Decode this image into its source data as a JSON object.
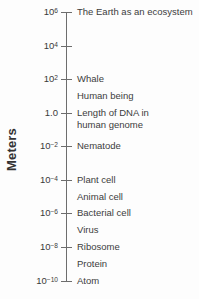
{
  "figure": {
    "axis_title": "Meters",
    "axis_color": "#6d6d6d",
    "text_color": "#3c3c3c",
    "background": "#fdfdfd"
  },
  "chart_data": {
    "type": "scatter",
    "title": "",
    "subtitle": "",
    "xlabel": "",
    "ylabel": "Meters",
    "orientation": "vertical-log-scale",
    "grid": false,
    "legend": null,
    "scale": "log10",
    "ylim": [
      1e-10,
      1000000.0
    ],
    "tick_values": [
      1000000.0,
      10000.0,
      100.0,
      1.0,
      0.01,
      0.0001,
      1e-06,
      1e-08,
      1e-10
    ],
    "ticks": [
      {
        "mantissa": "10",
        "exponent": "6",
        "display": "10⁶",
        "value": 1000000.0,
        "y": 12
      },
      {
        "mantissa": "10",
        "exponent": "4",
        "display": "10⁴",
        "value": 10000.0,
        "y": 46
      },
      {
        "mantissa": "10",
        "exponent": "2",
        "display": "10²",
        "value": 100.0,
        "y": 79
      },
      {
        "mantissa": "1.0",
        "exponent": "",
        "display": "1.0",
        "value": 1.0,
        "y": 113
      },
      {
        "mantissa": "10",
        "exponent": "−2",
        "display": "10⁻²",
        "value": 0.01,
        "y": 146
      },
      {
        "mantissa": "10",
        "exponent": "−4",
        "display": "10⁻⁴",
        "value": 0.0001,
        "y": 180
      },
      {
        "mantissa": "10",
        "exponent": "−6",
        "display": "10⁻⁶",
        "value": 1e-06,
        "y": 213
      },
      {
        "mantissa": "10",
        "exponent": "−8",
        "display": "10⁻⁸",
        "value": 1e-08,
        "y": 247
      },
      {
        "mantissa": "10",
        "exponent": "−10",
        "display": "10⁻¹⁰",
        "value": 1e-10,
        "y": 281
      }
    ],
    "annotations": [
      {
        "label": "The Earth as an ecosystem",
        "y": 12,
        "value": 1000000.0,
        "on_tick": true
      },
      {
        "label": "Whale",
        "y": 79,
        "value": 100.0,
        "on_tick": true
      },
      {
        "label": "Human being",
        "y": 96,
        "value": 5.0,
        "on_tick": false
      },
      {
        "label": "Length of DNA in\nhuman genome",
        "y": 113,
        "value": 1.0,
        "on_tick": true
      },
      {
        "label": "Nematode",
        "y": 146,
        "value": 0.01,
        "on_tick": true
      },
      {
        "label": "Plant cell",
        "y": 180,
        "value": 0.0001,
        "on_tick": true
      },
      {
        "label": "Animal cell",
        "y": 197,
        "value": 2e-05,
        "on_tick": false
      },
      {
        "label": "Bacterial cell",
        "y": 213,
        "value": 1e-06,
        "on_tick": true
      },
      {
        "label": "Virus",
        "y": 230,
        "value": 2e-07,
        "on_tick": false
      },
      {
        "label": "Ribosome",
        "y": 247,
        "value": 1e-08,
        "on_tick": true
      },
      {
        "label": "Protein",
        "y": 264,
        "value": 2e-09,
        "on_tick": false
      },
      {
        "label": "Atom",
        "y": 281,
        "value": 1e-10,
        "on_tick": true
      }
    ]
  }
}
